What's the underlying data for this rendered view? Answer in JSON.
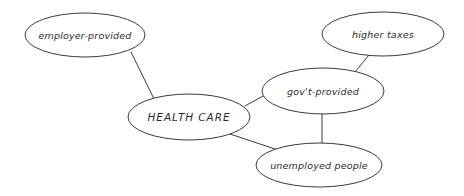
{
  "diagram": {
    "background_color": "#ffffff",
    "stroke_color": "#3a3a3a",
    "text_color": "#2b2b2b",
    "nodes": [
      {
        "id": "employer-provided",
        "label": "employer-provided",
        "cx": 85,
        "cy": 35,
        "rx": 60,
        "ry": 22,
        "style": "italic"
      },
      {
        "id": "higher-taxes",
        "label": "higher taxes",
        "cx": 383,
        "cy": 34,
        "rx": 61,
        "ry": 22,
        "style": "italic"
      },
      {
        "id": "govt-provided",
        "label": "gov't-provided",
        "cx": 323,
        "cy": 91,
        "rx": 61,
        "ry": 23,
        "style": "italic"
      },
      {
        "id": "health-care",
        "label": "HEALTH CARE",
        "cx": 189,
        "cy": 117,
        "rx": 61,
        "ry": 23,
        "style": "italic-caps"
      },
      {
        "id": "unemployed-people",
        "label": "unemployed people",
        "cx": 319,
        "cy": 165,
        "rx": 63,
        "ry": 22,
        "style": "italic"
      }
    ],
    "edges": [
      {
        "id": "employer-to-healthcare",
        "from": "employer-provided",
        "to": "health-care",
        "x1": 131,
        "y1": 52,
        "x2": 155,
        "y2": 101
      },
      {
        "id": "healthcare-to-govt",
        "from": "health-care",
        "to": "govt-provided",
        "x1": 245,
        "y1": 106,
        "x2": 265,
        "y2": 95
      },
      {
        "id": "healthcare-to-unemployed",
        "from": "health-care",
        "to": "unemployed-people",
        "x1": 230,
        "y1": 134,
        "x2": 278,
        "y2": 150
      },
      {
        "id": "govt-to-higher-taxes",
        "from": "govt-provided",
        "to": "higher-taxes",
        "x1": 355,
        "y1": 72,
        "x2": 369,
        "y2": 55
      },
      {
        "id": "govt-to-unemployed",
        "from": "govt-provided",
        "to": "unemployed-people",
        "x1": 322,
        "y1": 114,
        "x2": 322,
        "y2": 144
      }
    ]
  }
}
